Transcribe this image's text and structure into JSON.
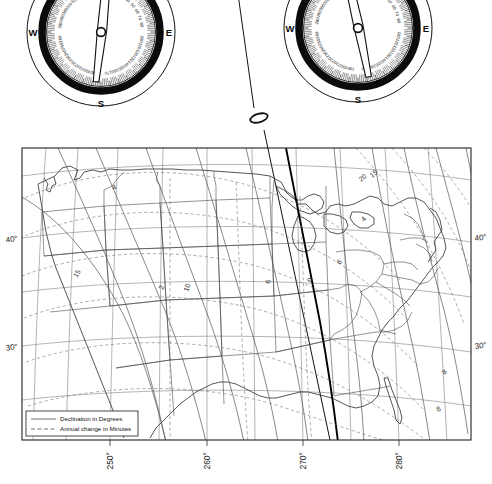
{
  "figure": {
    "kind": "diagram"
  },
  "compasses": [
    {
      "id": "compass-left",
      "name": "left-compass-rose",
      "center_x": 101,
      "center_y": 32,
      "radius": 74,
      "cardinals": [
        "N",
        "E",
        "S",
        "W"
      ],
      "degree_labels": [
        "10",
        "20",
        "30",
        "40",
        "50",
        "60",
        "70",
        "80",
        "100",
        "110",
        "120",
        "130",
        "140",
        "150",
        "160",
        "170",
        "190",
        "200",
        "210",
        "220",
        "230",
        "240",
        "250",
        "260",
        "280",
        "290",
        "300",
        "310",
        "320",
        "330",
        "340",
        "350"
      ],
      "needle_bearing_deg": 186,
      "needle_label": "magnetic-needle"
    },
    {
      "id": "compass-right",
      "name": "right-compass-rose",
      "center_x": 358,
      "center_y": 28,
      "radius": 74,
      "cardinals": [
        "N",
        "E",
        "S",
        "W"
      ],
      "degree_labels": [
        "10",
        "20",
        "30",
        "40",
        "50",
        "60",
        "70",
        "80",
        "100",
        "110",
        "120",
        "130",
        "140",
        "150",
        "160",
        "170",
        "190",
        "200",
        "210",
        "220",
        "230",
        "240",
        "250",
        "260",
        "280",
        "290",
        "300",
        "310",
        "320",
        "330",
        "340",
        "350"
      ],
      "needle_bearing_deg": 168,
      "needle_label": "magnetic-needle"
    }
  ],
  "marker": {
    "name": "station-marker",
    "shape": "ellipse",
    "x": 259,
    "y": 118
  },
  "map": {
    "name": "isogonic-map",
    "frame": {
      "x": 22,
      "y": 148,
      "width": 449,
      "height": 292
    },
    "latitude_labels": [
      {
        "text": "40°",
        "side": "left",
        "y": 238
      },
      {
        "text": "30°",
        "side": "left",
        "y": 346
      },
      {
        "text": "40°",
        "side": "right",
        "y": 238
      },
      {
        "text": "30°",
        "side": "right",
        "y": 346
      }
    ],
    "longitude_labels": [
      {
        "text": "250°",
        "x": 118
      },
      {
        "text": "260°",
        "x": 207
      },
      {
        "text": "270°",
        "x": 296
      },
      {
        "text": "280°",
        "x": 385
      }
    ],
    "declination_contour_labels": [
      "4",
      "15",
      "2",
      "10",
      "6",
      "0",
      "20",
      "15",
      "4",
      "6",
      "8",
      "8"
    ],
    "legend": {
      "name": "map-legend",
      "entries": [
        {
          "style": "solid",
          "label": "Declination in Degrees"
        },
        {
          "style": "dashed",
          "label": "Annual change in Minutes"
        }
      ]
    }
  },
  "chart_data": {
    "type": "line",
    "xlabel": "East longitude (degrees)",
    "ylabel": "North latitude (degrees)",
    "xlim": [
      245,
      290
    ],
    "ylim": [
      24,
      50
    ],
    "xticks": [
      250,
      260,
      270,
      280
    ],
    "xticklabels": [
      "250°",
      "260°",
      "270°",
      "280°"
    ],
    "yticks": [
      30,
      40
    ],
    "yticklabels": [
      "30°",
      "40°"
    ],
    "grid": true,
    "legend": [
      "Declination in Degrees",
      "Annual change in Minutes"
    ],
    "legend_position": "lower-left",
    "series": [
      {
        "name": "Declination in Degrees",
        "style": "solid",
        "values": [
          20,
          15,
          10,
          8,
          6,
          4,
          2,
          0,
          4,
          6,
          8,
          10,
          15
        ]
      },
      {
        "name": "Annual change in Minutes",
        "style": "dashed",
        "values": [
          2,
          4,
          6,
          8,
          10,
          15
        ]
      }
    ],
    "annotations": [
      "0 (agonic line)",
      "East declination west of agonic line",
      "West declination east of agonic line"
    ]
  }
}
